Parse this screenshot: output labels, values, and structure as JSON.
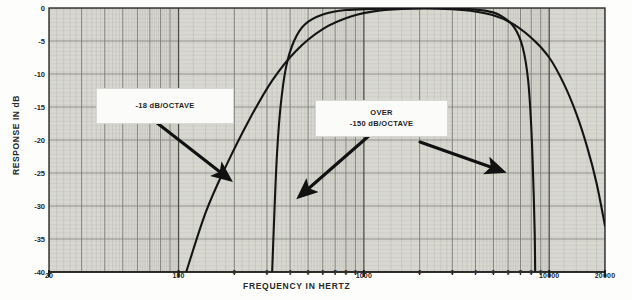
{
  "chart_data": {
    "type": "line",
    "title": "",
    "xlabel": "FREQUENCY IN HERTZ",
    "ylabel": "RESPONSE IN dB",
    "xscale": "log",
    "xlim": [
      20,
      20000
    ],
    "ylim": [
      -40,
      0
    ],
    "grid": true,
    "legend": false,
    "ytick_labels": [
      "0",
      "-5",
      "-10",
      "-15",
      "-20",
      "-25",
      "-30",
      "-35",
      "-40"
    ],
    "ytick_values": [
      0,
      -5,
      -10,
      -15,
      -20,
      -25,
      -30,
      -35,
      -40
    ],
    "xtick_major_labels": [
      "20",
      "100",
      "1000",
      "10000",
      "20000"
    ],
    "xtick_major_values": [
      20,
      100,
      1000,
      10000,
      20000
    ],
    "xtick_minor_labels": [
      "2",
      "3",
      "4",
      "5",
      "6",
      "7",
      "8",
      "9"
    ],
    "annotations": [
      {
        "id": "low-slope",
        "text_lines": [
          "-18 dB/OCTAVE"
        ]
      },
      {
        "id": "steep-slope",
        "text_lines": [
          "OVER",
          "-150 dB/OCTAVE"
        ]
      }
    ],
    "series": [
      {
        "name": "18 dB per octave filter",
        "slope_db_per_octave": -18,
        "points": [
          [
            110,
            -40
          ],
          [
            140,
            -31
          ],
          [
            180,
            -24
          ],
          [
            240,
            -17
          ],
          [
            320,
            -11
          ],
          [
            430,
            -6.5
          ],
          [
            600,
            -3.2
          ],
          [
            850,
            -1.3
          ],
          [
            1200,
            -0.4
          ],
          [
            1800,
            -0.1
          ],
          [
            3000,
            -0.2
          ],
          [
            4500,
            -0.8
          ],
          [
            6000,
            -2.0
          ],
          [
            8000,
            -4.5
          ],
          [
            10000,
            -7.5
          ],
          [
            12000,
            -11.5
          ],
          [
            14000,
            -16.0
          ],
          [
            16000,
            -21.0
          ],
          [
            18000,
            -26.5
          ],
          [
            20000,
            -33.0
          ]
        ]
      },
      {
        "name": "Over 150 dB per octave filter",
        "slope_db_per_octave": -150,
        "points": [
          [
            320,
            -40
          ],
          [
            330,
            -30
          ],
          [
            340,
            -22
          ],
          [
            355,
            -15
          ],
          [
            380,
            -9
          ],
          [
            420,
            -5
          ],
          [
            480,
            -2.5
          ],
          [
            600,
            -1.0
          ],
          [
            800,
            -0.3
          ],
          [
            1500,
            -0.05
          ],
          [
            3000,
            -0.05
          ],
          [
            4500,
            -0.4
          ],
          [
            5500,
            -1.2
          ],
          [
            6500,
            -3.0
          ],
          [
            7200,
            -6.0
          ],
          [
            7700,
            -11.0
          ],
          [
            8000,
            -18.0
          ],
          [
            8200,
            -26.0
          ],
          [
            8350,
            -34.0
          ],
          [
            8400,
            -40
          ]
        ]
      }
    ],
    "arrows": [
      {
        "id": "arrow-low-slope",
        "from": [
          152,
          119
        ],
        "to": [
          229,
          179
        ]
      },
      {
        "id": "arrow-steep-left",
        "from": [
          371,
          134
        ],
        "to": [
          300,
          196
        ]
      },
      {
        "id": "arrow-steep-right",
        "from": [
          420,
          142
        ],
        "to": [
          502,
          171
        ]
      }
    ]
  },
  "axes": {
    "ylabel": "RESPONSE IN dB",
    "xlabel": "FREQUENCY IN HERTZ"
  },
  "callouts": {
    "low_slope": "-18 dB/OCTAVE",
    "steep_slope_line1": "OVER",
    "steep_slope_line2": "-150 dB/OCTAVE"
  },
  "colors": {
    "curve": "#141414",
    "grid_major": "#7d7d78",
    "grid_minor": "#b4b4ae",
    "paper": "#e9e9e3",
    "text": "#1f1f1f"
  }
}
